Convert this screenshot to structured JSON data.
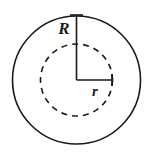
{
  "figure": {
    "type": "geometry-diagram",
    "background_color": "#ffffff",
    "stroke_color": "#1a1a1a",
    "canvas": {
      "width": 147,
      "height": 155
    }
  },
  "geometry": {
    "center": {
      "x": 76.5,
      "y": 80
    },
    "outer_circle": {
      "name": "outer-circle",
      "radius": 64,
      "stroke_style": "solid",
      "stroke_width": 1.6,
      "fill": "none"
    },
    "inner_circle": {
      "name": "inner-circle",
      "radius": 36,
      "stroke_style": "dashed",
      "stroke_width": 1.6,
      "dash_length": 6,
      "dash_gap": 5,
      "fill": "none"
    },
    "radius_R": {
      "name": "outer-radius-segment",
      "from": {
        "x": 76.5,
        "y": 80
      },
      "to": {
        "x": 76.5,
        "y": 15
      },
      "orientation": "vertical",
      "end_tick": {
        "length": 13,
        "orientation": "horizontal"
      },
      "stroke_width": 1.6
    },
    "radius_r": {
      "name": "inner-radius-segment",
      "from": {
        "x": 76.5,
        "y": 80
      },
      "to": {
        "x": 112,
        "y": 80
      },
      "orientation": "horizontal",
      "end_tick": {
        "length": 12,
        "orientation": "vertical"
      },
      "stroke_width": 1.6
    }
  },
  "labels": {
    "outer_radius": {
      "text": "R",
      "x": 64,
      "y": 34,
      "anchor": "middle",
      "meaning": "radius of outer circle"
    },
    "inner_radius": {
      "text": "r",
      "x": 95,
      "y": 96,
      "anchor": "middle",
      "meaning": "radius of inner circle"
    }
  }
}
